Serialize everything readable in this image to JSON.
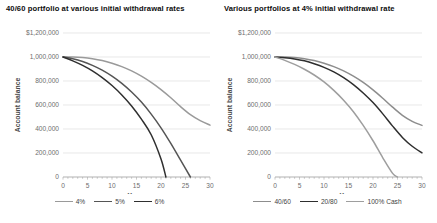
{
  "figure": {
    "width": 437,
    "height": 223,
    "background": "#ffffff"
  },
  "chart_data": [
    {
      "type": "line",
      "panel": "left",
      "title": "40/60 portfolio at various initial withdrawal rates",
      "xlabel": "Years",
      "ylabel": "Account balance",
      "xlim": [
        0,
        30
      ],
      "ylim": [
        0,
        1200000
      ],
      "xticks": [
        0,
        5,
        10,
        15,
        20,
        25,
        30
      ],
      "xticklabels": [
        "0",
        "5",
        "10",
        "15",
        "20",
        "25",
        "30"
      ],
      "yticks": [
        0,
        200000,
        400000,
        600000,
        800000,
        1000000,
        1200000
      ],
      "yticklabels": [
        "0",
        "200,000",
        "400,000",
        "600,000",
        "800,000",
        "1,000,000",
        "$1,200,000"
      ],
      "grid": "horizontal",
      "legend_position": "bottom",
      "series": [
        {
          "name": "4%",
          "color": "#9a9a9a",
          "x": [
            0,
            2,
            4,
            6,
            8,
            10,
            12,
            14,
            16,
            18,
            20,
            22,
            24,
            26,
            28,
            30
          ],
          "values": [
            1000000,
            1000000,
            995000,
            985000,
            970000,
            948000,
            920000,
            884000,
            840000,
            788000,
            728000,
            660000,
            586000,
            520000,
            470000,
            432000
          ]
        },
        {
          "name": "5%",
          "color": "#555555",
          "x": [
            0,
            2,
            4,
            6,
            8,
            10,
            12,
            14,
            16,
            18,
            20,
            22,
            24,
            26
          ],
          "values": [
            1000000,
            985000,
            962000,
            930000,
            890000,
            840000,
            780000,
            708000,
            624000,
            524000,
            410000,
            280000,
            140000,
            0
          ]
        },
        {
          "name": "6%",
          "color": "#2f2f2f",
          "x": [
            0,
            2,
            4,
            6,
            8,
            10,
            12,
            14,
            16,
            18,
            20,
            21
          ],
          "values": [
            1000000,
            968000,
            930000,
            884000,
            828000,
            762000,
            684000,
            592000,
            482000,
            352000,
            150000,
            0
          ]
        }
      ]
    },
    {
      "type": "line",
      "panel": "right",
      "title": "Various portfolios  at 4% initial withdrawal rate",
      "xlabel": "Years",
      "ylabel": "Account balance",
      "xlim": [
        0,
        30
      ],
      "ylim": [
        0,
        1200000
      ],
      "xticks": [
        0,
        5,
        10,
        15,
        20,
        25,
        30
      ],
      "xticklabels": [
        "0",
        "5",
        "10",
        "15",
        "20",
        "25",
        "30"
      ],
      "yticks": [
        0,
        200000,
        400000,
        600000,
        800000,
        1000000,
        1200000
      ],
      "yticklabels": [
        "0",
        "200,000",
        "400,000",
        "600,000",
        "800,000",
        "1,000,000",
        "$1,200,000"
      ],
      "grid": "horizontal",
      "legend_position": "bottom",
      "series": [
        {
          "name": "40/60",
          "color": "#8d8d8d",
          "x": [
            0,
            2,
            4,
            6,
            8,
            10,
            12,
            14,
            16,
            18,
            20,
            22,
            24,
            26,
            28,
            30
          ],
          "values": [
            1000000,
            1000000,
            995000,
            985000,
            970000,
            948000,
            920000,
            884000,
            840000,
            788000,
            726000,
            656000,
            582000,
            514000,
            464000,
            430000
          ]
        },
        {
          "name": "20/80",
          "color": "#2e2e2e",
          "x": [
            0,
            2,
            4,
            6,
            8,
            10,
            12,
            14,
            16,
            18,
            20,
            22,
            24,
            26,
            28,
            30
          ],
          "values": [
            1000000,
            994000,
            984000,
            968000,
            944000,
            914000,
            876000,
            828000,
            770000,
            700000,
            620000,
            526000,
            424000,
            330000,
            256000,
            202000
          ]
        },
        {
          "name": "100% Cash",
          "color": "#9e9e9e",
          "x": [
            0,
            2,
            4,
            6,
            8,
            10,
            12,
            14,
            16,
            18,
            20,
            22,
            24,
            25
          ],
          "values": [
            1000000,
            972000,
            938000,
            898000,
            850000,
            792000,
            722000,
            640000,
            544000,
            430000,
            302000,
            160000,
            30000,
            0
          ]
        }
      ]
    }
  ]
}
